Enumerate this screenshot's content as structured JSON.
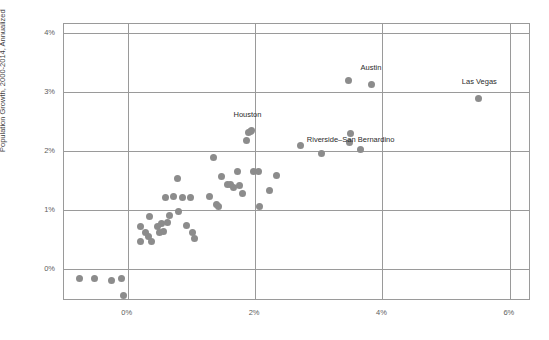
{
  "chart_data": {
    "type": "scatter",
    "title": "",
    "xlabel": "",
    "ylabel": "Population Growth, 2000-2014, Annualized",
    "xlim": [
      -1.0,
      6.3
    ],
    "ylim": [
      -0.5,
      4.15
    ],
    "xticks": [
      "0%",
      "2%",
      "4%",
      "6%"
    ],
    "xtick_values": [
      0,
      2,
      4,
      6
    ],
    "yticks": [
      "0%",
      "1%",
      "2%",
      "3%",
      "4%"
    ],
    "ytick_values": [
      0,
      1,
      2,
      3,
      4
    ],
    "grid": true,
    "legend": "none",
    "point_color": "#8c8c8c",
    "grid_color": "#9a9a9a",
    "points": [
      {
        "x": -0.75,
        "y": -0.15,
        "label": ""
      },
      {
        "x": -0.52,
        "y": -0.15,
        "label": ""
      },
      {
        "x": -0.25,
        "y": -0.19,
        "label": ""
      },
      {
        "x": -0.09,
        "y": -0.15,
        "label": ""
      },
      {
        "x": -0.06,
        "y": -0.44,
        "label": ""
      },
      {
        "x": 0.2,
        "y": 0.48,
        "label": ""
      },
      {
        "x": 0.2,
        "y": 0.73,
        "label": ""
      },
      {
        "x": 0.28,
        "y": 0.62,
        "label": ""
      },
      {
        "x": 0.33,
        "y": 0.55,
        "label": ""
      },
      {
        "x": 0.35,
        "y": 0.89,
        "label": ""
      },
      {
        "x": 0.38,
        "y": 0.47,
        "label": ""
      },
      {
        "x": 0.46,
        "y": 0.72,
        "label": ""
      },
      {
        "x": 0.5,
        "y": 0.63,
        "label": ""
      },
      {
        "x": 0.53,
        "y": 0.77,
        "label": ""
      },
      {
        "x": 0.56,
        "y": 0.64,
        "label": ""
      },
      {
        "x": 0.6,
        "y": 1.22,
        "label": ""
      },
      {
        "x": 0.62,
        "y": 0.8,
        "label": ""
      },
      {
        "x": 0.66,
        "y": 0.92,
        "label": ""
      },
      {
        "x": 0.72,
        "y": 1.23,
        "label": ""
      },
      {
        "x": 0.78,
        "y": 1.53,
        "label": ""
      },
      {
        "x": 0.8,
        "y": 0.98,
        "label": ""
      },
      {
        "x": 0.86,
        "y": 1.22,
        "label": ""
      },
      {
        "x": 0.93,
        "y": 0.75,
        "label": ""
      },
      {
        "x": 0.98,
        "y": 1.22,
        "label": ""
      },
      {
        "x": 1.02,
        "y": 0.63,
        "label": ""
      },
      {
        "x": 1.05,
        "y": 0.52,
        "label": ""
      },
      {
        "x": 1.28,
        "y": 1.24,
        "label": ""
      },
      {
        "x": 1.34,
        "y": 1.89,
        "label": ""
      },
      {
        "x": 1.4,
        "y": 1.09,
        "label": ""
      },
      {
        "x": 1.43,
        "y": 1.06,
        "label": ""
      },
      {
        "x": 1.48,
        "y": 1.57,
        "label": ""
      },
      {
        "x": 1.56,
        "y": 1.44,
        "label": ""
      },
      {
        "x": 1.62,
        "y": 1.43,
        "label": ""
      },
      {
        "x": 1.66,
        "y": 1.39,
        "label": ""
      },
      {
        "x": 1.72,
        "y": 1.65,
        "label": ""
      },
      {
        "x": 1.75,
        "y": 1.42,
        "label": ""
      },
      {
        "x": 1.8,
        "y": 1.29,
        "label": ""
      },
      {
        "x": 1.86,
        "y": 2.18,
        "label": ""
      },
      {
        "x": 1.9,
        "y": 2.32,
        "label": ""
      },
      {
        "x": 1.94,
        "y": 2.35,
        "label": ""
      },
      {
        "x": 1.97,
        "y": 1.66,
        "label": ""
      },
      {
        "x": 2.05,
        "y": 1.66,
        "label": ""
      },
      {
        "x": 2.07,
        "y": 1.07,
        "label": ""
      },
      {
        "x": 2.22,
        "y": 1.34,
        "label": ""
      },
      {
        "x": 2.33,
        "y": 1.58,
        "label": ""
      },
      {
        "x": 2.72,
        "y": 2.1,
        "label": ""
      },
      {
        "x": 3.04,
        "y": 1.96,
        "label": ""
      },
      {
        "x": 3.46,
        "y": 3.19,
        "label": ""
      },
      {
        "x": 3.5,
        "y": 2.3,
        "label": "Riverside-San Bernardino"
      },
      {
        "x": 3.48,
        "y": 2.14,
        "label": ""
      },
      {
        "x": 3.66,
        "y": 2.02,
        "label": ""
      },
      {
        "x": 3.82,
        "y": 3.12,
        "label": "Austin"
      },
      {
        "x": 5.5,
        "y": 2.89,
        "label": "Las Vegas"
      },
      {
        "x": 1.92,
        "y": 2.33,
        "label": "Houston"
      }
    ],
    "annotations": [
      {
        "text": "Houston",
        "x": 1.88,
        "y": 2.62
      },
      {
        "text": "Austin",
        "x": 3.82,
        "y": 3.42
      },
      {
        "text": "Riverside–San Bernardino",
        "x": 3.5,
        "y": 2.21
      },
      {
        "text": "Las Vegas",
        "x": 5.52,
        "y": 3.18
      }
    ]
  }
}
